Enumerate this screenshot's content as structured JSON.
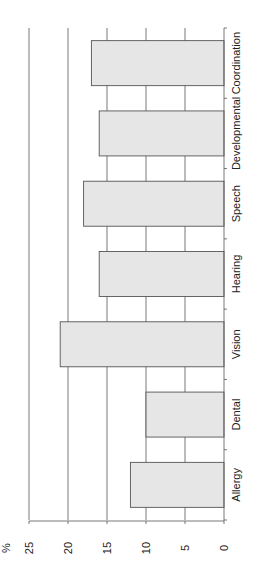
{
  "chart_data": {
    "type": "bar",
    "orientation": "rotated-90-clockwise",
    "title": "",
    "xlabel": "",
    "ylabel": "%",
    "categories": [
      "Allergy",
      "Dental",
      "Vision",
      "Hearing",
      "Speech",
      "Developmental",
      "Coordination"
    ],
    "values": [
      12,
      10,
      21,
      16,
      18,
      16,
      17
    ],
    "ylim": [
      0,
      25
    ],
    "yticks": [
      0,
      5,
      10,
      15,
      20,
      25
    ],
    "grid": true,
    "legend": null,
    "colors": {
      "bar_fill": "#e6e6e6",
      "bar_stroke": "#555555",
      "grid": "#555555",
      "text": "#222222"
    }
  }
}
